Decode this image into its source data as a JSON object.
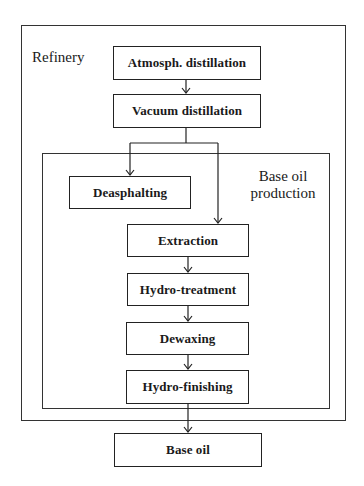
{
  "diagram": {
    "groups": {
      "refinery": {
        "label": "Refinery"
      },
      "base_oil_production": {
        "label_line1": "Base oil",
        "label_line2": "production"
      }
    },
    "nodes": {
      "atmospheric_distillation": "Atmosph. distillation",
      "vacuum_distillation": "Vacuum distillation",
      "deasphalting": "Deasphalting",
      "extraction": "Extraction",
      "hydro_treatment": "Hydro-treatment",
      "dewaxing": "Dewaxing",
      "hydro_finishing": "Hydro-finishing",
      "base_oil": "Base oil"
    },
    "edges": [
      [
        "Atmosph. distillation",
        "Vacuum distillation"
      ],
      [
        "Vacuum distillation",
        "Deasphalting"
      ],
      [
        "Vacuum distillation",
        "Extraction"
      ],
      [
        "Extraction",
        "Hydro-treatment"
      ],
      [
        "Hydro-treatment",
        "Dewaxing"
      ],
      [
        "Dewaxing",
        "Hydro-finishing"
      ],
      [
        "Hydro-finishing",
        "Base oil"
      ]
    ]
  }
}
